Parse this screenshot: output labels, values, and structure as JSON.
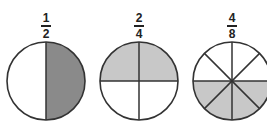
{
  "colors": {
    "outline": "#333333",
    "dark_fill": "#8a8a8a",
    "light_fill": "#c8c8c8",
    "empty_fill": "#ffffff"
  },
  "figures": [
    {
      "numerator": "1",
      "denominator": "2",
      "parts": 2,
      "shaded": 1,
      "shaded_region": "right half",
      "fill": "dark"
    },
    {
      "numerator": "2",
      "denominator": "4",
      "parts": 4,
      "shaded": 2,
      "shaded_region": "top half",
      "fill": "light"
    },
    {
      "numerator": "4",
      "denominator": "8",
      "parts": 8,
      "shaded": 4,
      "shaded_region": "bottom half",
      "fill": "light"
    }
  ]
}
